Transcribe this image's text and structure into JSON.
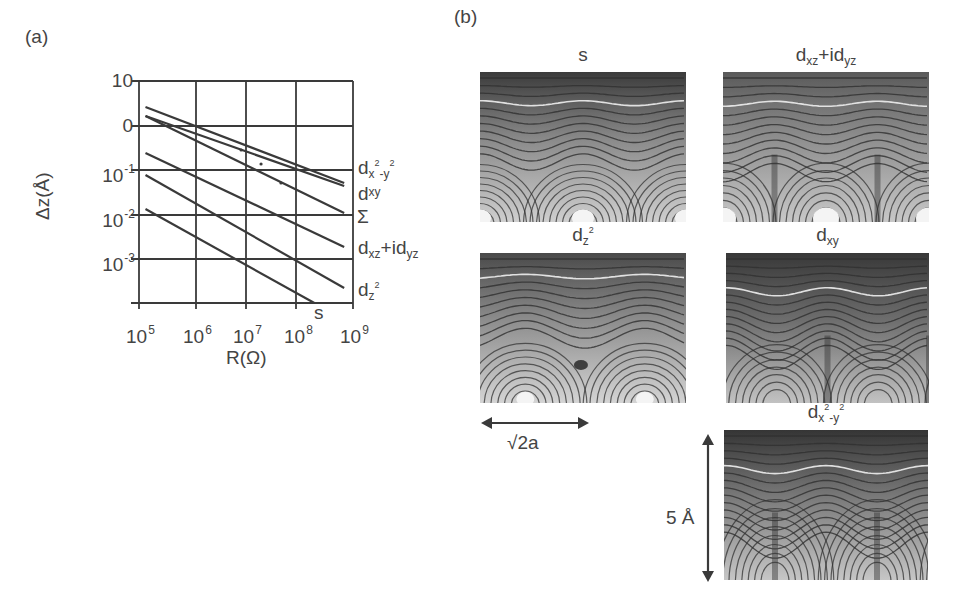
{
  "figure": {
    "panel_a_label": "(a)",
    "panel_b_label": "(b)"
  },
  "chart_data": {
    "type": "line",
    "title": "",
    "xlabel": "R(Ω)",
    "ylabel": "Δz(Å)",
    "xscale": "log",
    "x_ticks": [
      "10^5",
      "10^6",
      "10^7",
      "10^8",
      "10^9"
    ],
    "y_ticks": [
      "10",
      "0",
      "10^-1",
      "10^-2",
      "10^-3"
    ],
    "grid": true,
    "series": [
      {
        "name": "d_{x²-y²}",
        "x": [
          130000.0,
          700000000.0
        ],
        "y_pixels": [
          107,
          183
        ]
      },
      {
        "name": "d_{xy}",
        "x": [
          130000.0,
          700000000.0
        ],
        "y_pixels": [
          116,
          186
        ]
      },
      {
        "name": "Σ",
        "x": [
          130000.0,
          700000000.0
        ],
        "y_pixels": [
          116,
          213
        ]
      },
      {
        "name": "d_{xz}+id_{yz}",
        "x": [
          130000.0,
          700000000.0
        ],
        "y_pixels": [
          153,
          247
        ]
      },
      {
        "name": "d_{z²}",
        "x": [
          130000.0,
          700000000.0
        ],
        "y_pixels": [
          175,
          288
        ]
      },
      {
        "name": "s",
        "x": [
          130000.0,
          210000000.0
        ],
        "y_pixels": [
          209,
          303
        ]
      }
    ],
    "markers": [
      {
        "x": 8000000.0,
        "note": "dot"
      },
      {
        "x": 20000000.0,
        "note": "dot"
      },
      {
        "x": 50000000.0,
        "note": "dot"
      }
    ],
    "legend_position": "right, inline labels"
  },
  "plot_a": {
    "x_tick_bases": [
      "10",
      "10",
      "10",
      "10",
      "10"
    ],
    "x_tick_exps": [
      "5",
      "6",
      "7",
      "8",
      "9"
    ],
    "y_tick_bases": [
      "10",
      "0",
      "10",
      "10",
      "10"
    ],
    "y_tick_exps": [
      "",
      "",
      "-1",
      "-2",
      "-3"
    ],
    "xlabel": "R(Ω)",
    "ylabel": "Δz(Å)",
    "labels": {
      "dx2y2_base": "d",
      "dx2y2_sub": "x",
      "dx2y2_sup1": "2",
      "dx2y2_mid": "-y",
      "dx2y2_sup2": "2",
      "dxy_base": "d",
      "dxy_sub": "xy",
      "sigma": "Σ",
      "dxz_base": "d",
      "dxz_sub": "xz",
      "dxz_plus": "+id",
      "dxz_sub2": "yz",
      "dz2_base": "d",
      "dz2_sub": "z",
      "dz2_sup": "2",
      "s": "s"
    }
  },
  "maps": [
    {
      "id": "s",
      "title_base": "s",
      "title_sub": "",
      "title_sup": "",
      "title_rest": "",
      "title_sub2": ""
    },
    {
      "id": "dxz",
      "title_base": "d",
      "title_sub": "xz",
      "title_sup": "",
      "title_rest": "+id",
      "title_sub2": "yz"
    },
    {
      "id": "dz2",
      "title_base": "d",
      "title_sub": "z",
      "title_sup": "2",
      "title_rest": "",
      "title_sub2": ""
    },
    {
      "id": "dxy",
      "title_base": "d",
      "title_sub": "xy",
      "title_sup": "",
      "title_rest": "",
      "title_sub2": ""
    },
    {
      "id": "dx2y2",
      "title_base": "d",
      "title_sub": "x",
      "title_sup": "2",
      "title_rest": "-y",
      "title_sub2": "2"
    }
  ],
  "scale_bars": {
    "horizontal_label": "√2a",
    "vertical_label": "5 Å"
  },
  "colors": {
    "line": "#3a3a3a",
    "grid": "#3a3a3a",
    "contour_dark": "#2e2e2e",
    "contour_light": "#e6e6e6"
  }
}
